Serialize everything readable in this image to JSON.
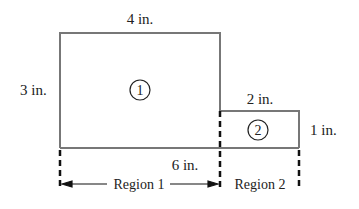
{
  "diagram": {
    "regions": [
      {
        "id": "1",
        "label": "Region 1",
        "marker": "1",
        "width_label": "4 in.",
        "height_label": "3 in."
      },
      {
        "id": "2",
        "label": "Region 2",
        "marker": "2",
        "width_label": "2 in.",
        "height_label": "1 in."
      }
    ],
    "total_width_label": "6 in.",
    "line_color": "#777777",
    "dash_color": "#111111"
  }
}
